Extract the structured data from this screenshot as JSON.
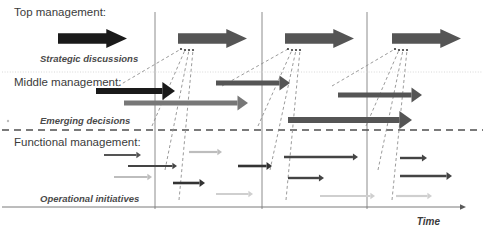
{
  "figure": {
    "title": "",
    "background": "#ffffff",
    "width": 485,
    "height": 232
  },
  "colors": {
    "black": "#1a1a1a",
    "dark_gray": "#555555",
    "mid_gray": "#777777",
    "light_gray": "#bdbdbd",
    "pale_gray": "#cfcfcf",
    "rule_gray": "#8c8c8c",
    "faint_gray": "#d8d8d8",
    "text": "#3b3b3b"
  },
  "bands": [
    {
      "id": "top",
      "label": "Top management:"
    },
    {
      "id": "middle",
      "label": "Middle management:"
    },
    {
      "id": "functional",
      "label": "Functional management:"
    }
  ],
  "flow_labels": [
    {
      "id": "strategic",
      "label": "Strategic discussions"
    },
    {
      "id": "emerging",
      "label": "Emerging decisions"
    },
    {
      "id": "operational",
      "label": "Operational initiatives"
    }
  ],
  "axis": {
    "label": "Time",
    "direction": "right",
    "y": 207,
    "x_start": 2,
    "x_end": 466
  },
  "separators": {
    "vertical_lines": [
      155,
      262,
      367
    ],
    "dotted_horizontal_y": 72,
    "dashed_horizontal_y": 130,
    "bullet_dot": {
      "x": 8,
      "y": 121
    }
  },
  "chart_data": {
    "type": "diagram",
    "block_arrows": [
      {
        "id": "top-1",
        "x": 58,
        "y": 29,
        "w": 69,
        "h": 19,
        "color": "#1a1a1a"
      },
      {
        "id": "top-2",
        "x": 178,
        "y": 29,
        "w": 69,
        "h": 19,
        "color": "#555555"
      },
      {
        "id": "top-3",
        "x": 285,
        "y": 29,
        "w": 69,
        "h": 19,
        "color": "#555555"
      },
      {
        "id": "top-4",
        "x": 392,
        "y": 29,
        "w": 69,
        "h": 19,
        "color": "#555555"
      }
    ],
    "line_arrows": [
      {
        "id": "mid-1",
        "x1": 96,
        "x2": 175,
        "y": 91,
        "w": 6,
        "color": "#1a1a1a"
      },
      {
        "id": "mid-2",
        "x1": 124,
        "x2": 248,
        "y": 103,
        "w": 5,
        "color": "#777777"
      },
      {
        "id": "mid-3",
        "x1": 216,
        "x2": 290,
        "y": 83,
        "w": 5,
        "color": "#555555"
      },
      {
        "id": "mid-4",
        "x1": 338,
        "x2": 422,
        "y": 95,
        "w": 5,
        "color": "#555555"
      },
      {
        "id": "mid-5",
        "x1": 288,
        "x2": 412,
        "y": 120,
        "w": 6,
        "color": "#555555"
      },
      {
        "id": "fn-1",
        "x1": 104,
        "x2": 141,
        "y": 155,
        "w": 2.2,
        "color": "#555555"
      },
      {
        "id": "fn-2",
        "x1": 128,
        "x2": 177,
        "y": 166,
        "w": 2.2,
        "color": "#444444"
      },
      {
        "id": "fn-3",
        "x1": 114,
        "x2": 152,
        "y": 177,
        "w": 2.2,
        "color": "#bdbdbd"
      },
      {
        "id": "fn-4",
        "x1": 189,
        "x2": 222,
        "y": 152,
        "w": 2.2,
        "color": "#bdbdbd"
      },
      {
        "id": "fn-5",
        "x1": 173,
        "x2": 205,
        "y": 183,
        "w": 2.6,
        "color": "#333333"
      },
      {
        "id": "fn-6",
        "x1": 238,
        "x2": 272,
        "y": 166,
        "w": 2.6,
        "color": "#333333"
      },
      {
        "id": "fn-7",
        "x1": 216,
        "x2": 253,
        "y": 194,
        "w": 2.2,
        "color": "#cfcfcf"
      },
      {
        "id": "fn-8",
        "x1": 284,
        "x2": 358,
        "y": 157,
        "w": 2.4,
        "color": "#444444"
      },
      {
        "id": "fn-9",
        "x1": 288,
        "x2": 324,
        "y": 178,
        "w": 2.4,
        "color": "#444444"
      },
      {
        "id": "fn-10",
        "x1": 320,
        "x2": 375,
        "y": 196,
        "w": 2.2,
        "color": "#cfcfcf"
      },
      {
        "id": "fn-11",
        "x1": 400,
        "x2": 427,
        "y": 158,
        "w": 2.4,
        "color": "#444444"
      },
      {
        "id": "fn-12",
        "x1": 400,
        "x2": 452,
        "y": 176,
        "w": 2.6,
        "color": "#444444"
      },
      {
        "id": "fn-13",
        "x1": 396,
        "x2": 432,
        "y": 196,
        "w": 2.2,
        "color": "#cfcfcf"
      }
    ],
    "converging_dashed_lines": [
      {
        "to_x": 181,
        "to_y": 49,
        "from_x": 118,
        "from_y": 86
      },
      {
        "to_x": 185,
        "to_y": 50,
        "from_x": 152,
        "from_y": 126
      },
      {
        "to_x": 189,
        "to_y": 50,
        "from_x": 165,
        "from_y": 170
      },
      {
        "to_x": 193,
        "to_y": 50,
        "from_x": 179,
        "from_y": 200
      },
      {
        "to_x": 288,
        "to_y": 49,
        "from_x": 222,
        "from_y": 86
      },
      {
        "to_x": 292,
        "to_y": 50,
        "from_x": 258,
        "from_y": 126
      },
      {
        "to_x": 296,
        "to_y": 50,
        "from_x": 270,
        "from_y": 170
      },
      {
        "to_x": 300,
        "to_y": 50,
        "from_x": 286,
        "from_y": 200
      },
      {
        "to_x": 395,
        "to_y": 49,
        "from_x": 332,
        "from_y": 86
      },
      {
        "to_x": 399,
        "to_y": 50,
        "from_x": 366,
        "from_y": 126
      },
      {
        "to_x": 403,
        "to_y": 50,
        "from_x": 378,
        "from_y": 170
      },
      {
        "to_x": 407,
        "to_y": 50,
        "from_x": 392,
        "from_y": 200
      }
    ]
  },
  "text_positions": {
    "top_management": {
      "x": 14,
      "y": 16
    },
    "strategic_discussions": {
      "x": 40,
      "y": 62
    },
    "middle_management": {
      "x": 14,
      "y": 86
    },
    "emerging_decisions": {
      "x": 40,
      "y": 124
    },
    "functional_management": {
      "x": 14,
      "y": 146
    },
    "operational_initiatives": {
      "x": 40,
      "y": 202
    },
    "time": {
      "x": 440,
      "y": 225
    }
  }
}
